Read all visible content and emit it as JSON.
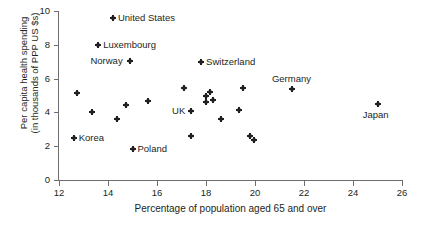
{
  "chart_data": {
    "type": "scatter",
    "title": "",
    "xlabel": "Percentage of population aged 65 and over",
    "ylabel": "Per capita health spending (in thousands of PPP US $s)",
    "ylabel_line1": "Per capita health spending",
    "ylabel_line2": "(in thousands of PPP US $s)",
    "xlim": [
      12,
      26
    ],
    "ylim": [
      0,
      10
    ],
    "xticks": [
      "12",
      "14",
      "16",
      "18",
      "20",
      "22",
      "24",
      "26"
    ],
    "xtick_values": [
      12,
      14,
      16,
      18,
      20,
      22,
      24,
      26
    ],
    "yticks": [
      "0",
      "2",
      "4",
      "6",
      "8",
      "10"
    ],
    "ytick_values": [
      0,
      2,
      4,
      6,
      8,
      10
    ],
    "grid": false,
    "legend": "none",
    "marker": "star-dot",
    "marker_color": "#231f20",
    "axis_color": "#6d6e71",
    "points": [
      {
        "label": "United States",
        "x": 14.2,
        "y": 9.6,
        "label_side": "right"
      },
      {
        "label": "Luxembourg",
        "x": 13.6,
        "y": 8.0,
        "label_side": "right"
      },
      {
        "label": "Norway",
        "x": 14.9,
        "y": 7.05,
        "label_side": "left"
      },
      {
        "label": "Switzerland",
        "x": 17.8,
        "y": 7.0,
        "label_side": "right"
      },
      {
        "label": "Germany",
        "x": 21.5,
        "y": 5.4,
        "label_side": "above"
      },
      {
        "label": "Japan",
        "x": 25.0,
        "y": 4.5,
        "label_side": "below"
      },
      {
        "label": "UK",
        "x": 17.4,
        "y": 4.1,
        "label_side": "left"
      },
      {
        "label": "Korea",
        "x": 12.6,
        "y": 2.5,
        "label_side": "right"
      },
      {
        "label": "Poland",
        "x": 15.0,
        "y": 1.85,
        "label_side": "right"
      },
      {
        "label": "",
        "x": 12.75,
        "y": 5.15,
        "label_side": ""
      },
      {
        "label": "",
        "x": 13.35,
        "y": 4.05,
        "label_side": ""
      },
      {
        "label": "",
        "x": 14.35,
        "y": 3.6,
        "label_side": ""
      },
      {
        "label": "",
        "x": 14.75,
        "y": 4.45,
        "label_side": ""
      },
      {
        "label": "",
        "x": 15.65,
        "y": 4.7,
        "label_side": ""
      },
      {
        "label": "",
        "x": 17.1,
        "y": 5.45,
        "label_side": ""
      },
      {
        "label": "",
        "x": 17.4,
        "y": 2.6,
        "label_side": ""
      },
      {
        "label": "",
        "x": 18.0,
        "y": 4.95,
        "label_side": ""
      },
      {
        "label": "",
        "x": 18.15,
        "y": 5.2,
        "label_side": ""
      },
      {
        "label": "",
        "x": 18.0,
        "y": 4.6,
        "label_side": ""
      },
      {
        "label": "",
        "x": 18.3,
        "y": 4.75,
        "label_side": ""
      },
      {
        "label": "",
        "x": 18.6,
        "y": 3.6,
        "label_side": ""
      },
      {
        "label": "",
        "x": 19.5,
        "y": 5.45,
        "label_side": ""
      },
      {
        "label": "",
        "x": 19.35,
        "y": 4.15,
        "label_side": ""
      },
      {
        "label": "",
        "x": 19.8,
        "y": 2.6,
        "label_side": ""
      },
      {
        "label": "",
        "x": 19.95,
        "y": 2.35,
        "label_side": ""
      }
    ]
  }
}
